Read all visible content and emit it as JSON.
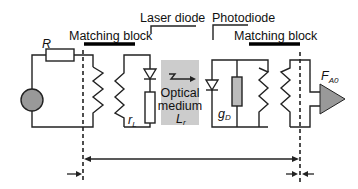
{
  "diagram": {
    "labels": {
      "resistor": "R",
      "matching_block_left": "Matching block",
      "laser_diode": "Laser diode",
      "photodiode": "Photodiode",
      "matching_block_right": "Matching block",
      "optical_medium_line1": "Optical",
      "optical_medium_line2": "medium",
      "optical_medium_symbol": "L",
      "optical_medium_subscript": "r",
      "laser_resistance_symbol": "r",
      "laser_resistance_subscript": "L",
      "photodiode_conductance_symbol": "g",
      "photodiode_conductance_subscript": "D",
      "amplifier_symbol": "F",
      "amplifier_subscript": "A0"
    },
    "colors": {
      "source_fill": "#999999",
      "optical_medium_fill": "#cccccc",
      "gd_resistor_fill": "#bbbbbb",
      "amplifier_fill": "#999999",
      "line": "#222222"
    }
  }
}
